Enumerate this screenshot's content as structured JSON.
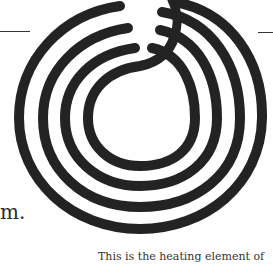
{
  "text_fragment": "m.",
  "caption": "This is the heating element of",
  "figure": {
    "coil_color": "#222222",
    "background": "#ffffff"
  }
}
